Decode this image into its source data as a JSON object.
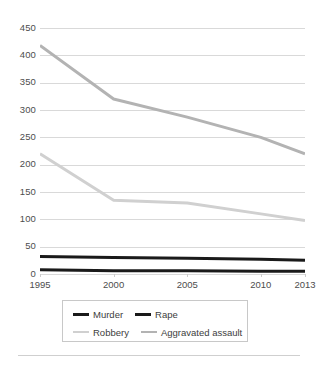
{
  "chart_data": {
    "type": "line",
    "title": "",
    "subtitle": "",
    "xlabel": "",
    "ylabel": "",
    "x": [
      1995,
      2000,
      2005,
      2010,
      2013
    ],
    "xticklabels": [
      "1995",
      "2000",
      "2005",
      "2010",
      "2013"
    ],
    "yticklabels": [
      "0",
      "50",
      "100",
      "150",
      "200",
      "250",
      "300",
      "350",
      "400",
      "450"
    ],
    "yticks": [
      0,
      50,
      100,
      150,
      200,
      250,
      300,
      350,
      400,
      450
    ],
    "ylim": [
      0,
      450
    ],
    "xlim": [
      1995,
      2013
    ],
    "grid": "horizontal",
    "legend_position": "bottom-center",
    "series": [
      {
        "name": "Murder",
        "values": [
          8,
          6,
          6,
          5,
          5
        ],
        "color": "#1a1a1a",
        "width": 3
      },
      {
        "name": "Rape",
        "values": [
          32,
          30,
          29,
          27,
          25
        ],
        "color": "#1a1a1a",
        "width": 3
      },
      {
        "name": "Robbery",
        "values": [
          220,
          135,
          130,
          110,
          98
        ],
        "color": "#d0d0d0",
        "width": 3
      },
      {
        "name": "Aggravated assault",
        "values": [
          418,
          320,
          287,
          250,
          220
        ],
        "color": "#b3b3b3",
        "width": 3
      }
    ]
  },
  "legend": {
    "items": [
      {
        "label": "Murder",
        "color": "#1a1a1a"
      },
      {
        "label": "Rape",
        "color": "#1a1a1a"
      },
      {
        "label": "Robbery",
        "color": "#d0d0d0"
      },
      {
        "label": "Aggravated assault",
        "color": "#b3b3b3"
      }
    ]
  },
  "colors": {
    "gridline": "#d9d9d9",
    "axis_text": "#4d4d4d",
    "background": "#ffffff",
    "legend_border": "#c8c8c8",
    "divider": "#cfcfcf"
  }
}
